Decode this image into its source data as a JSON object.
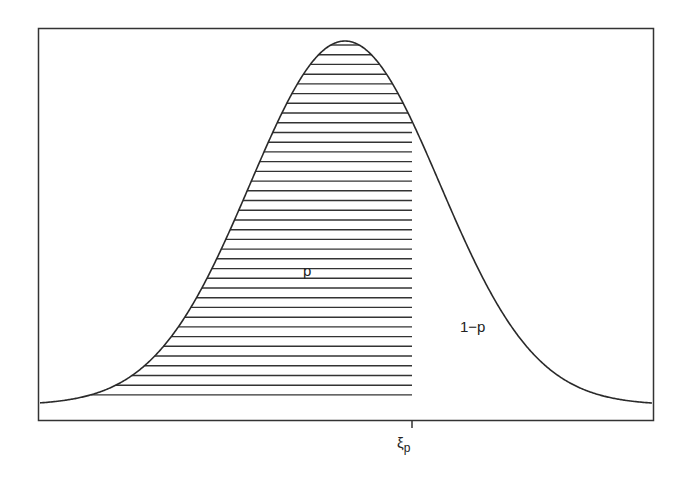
{
  "chart_data": {
    "type": "area",
    "title": "",
    "xlabel": "",
    "ylabel": "",
    "distribution": {
      "shape": "normal",
      "center_px": 345,
      "sigma_px": 95
    },
    "x_ticks": [
      {
        "label": "ξp",
        "position_px": 412
      }
    ],
    "annotations": [
      {
        "text": "p",
        "region": "hatched area left of ξp"
      },
      {
        "text": "1−p",
        "region": "unshaded area right of ξp"
      }
    ],
    "shaded_region": {
      "from": "-inf",
      "to": "ξp",
      "fill": "horizontal hatching"
    },
    "grid": false,
    "legend": null,
    "colors": {
      "line": "#2a2a2a",
      "hatch": "#333333",
      "frame": "#333333"
    }
  },
  "labels": {
    "area_left": "p",
    "area_right": "1−p",
    "tick_symbol": "ξ",
    "tick_subscript": "p"
  }
}
